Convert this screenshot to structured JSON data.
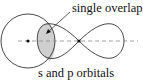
{
  "diagram": {
    "callout_label": "single overlap",
    "caption": "s and p orbitals",
    "colors": {
      "stroke": "#333333",
      "overlap_fill": "#cfcfcf",
      "axis": "#888888",
      "background": "#ffffff"
    },
    "elements": {
      "s_orbital": "circle",
      "p_orbital": "two-lobed figure-eight",
      "overlap_region": "shaded lens",
      "axis": "dashed internuclear axis",
      "nuclei": [
        "s nucleus dot",
        "p nucleus dot"
      ]
    }
  }
}
